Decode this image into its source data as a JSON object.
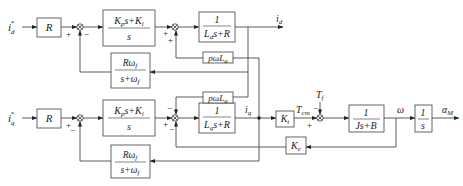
{
  "diagram": {
    "d_axis": {
      "input": "i",
      "input_sub": "d",
      "input_sup": "*",
      "gain_block": "R",
      "pi_block": {
        "num_a": "K",
        "num_a_sub": "p",
        "num_b": "s+K",
        "num_b_sub": "i",
        "den": "s"
      },
      "plant_block": {
        "num": "1",
        "den_a": "L",
        "den_a_sub": "d",
        "den_b": "s+R"
      },
      "output": "i",
      "output_sub": "d",
      "filter_block": {
        "num": "Rω",
        "num_sub": "f",
        "den": "s+ω",
        "den_sub": "f"
      },
      "coupling_block": {
        "text": "pωL",
        "sub": "a"
      },
      "sum1_signs": [
        "+",
        "−"
      ],
      "sum2_signs": [
        "+",
        "+"
      ]
    },
    "q_axis": {
      "input": "i",
      "input_sub": "q",
      "input_sup": "*",
      "gain_block": "R",
      "pi_block": {
        "num_a": "K",
        "num_a_sub": "p",
        "num_b": "s+K",
        "num_b_sub": "i",
        "den": "s"
      },
      "plant_block": {
        "num": "1",
        "den_a": "L",
        "den_a_sub": "q",
        "den_b": "s+R"
      },
      "output": "i",
      "output_sub": "q",
      "filter_block": {
        "num": "Rω",
        "num_sub": "f",
        "den": "s+ω",
        "den_sub": "f"
      },
      "coupling_block": {
        "text": "pωL",
        "sub": "a"
      },
      "sum3_signs": [
        "+",
        "−"
      ],
      "sum4_signs": [
        "−",
        "+",
        "−"
      ]
    },
    "mechanical": {
      "torque_gain": "K",
      "torque_gain_sub": "t",
      "torque_label": "T",
      "torque_label_sub": "cm",
      "load_torque": "T",
      "load_torque_sub": "f",
      "sum5_signs": [
        "−",
        "+"
      ],
      "inertia_block": {
        "num": "1",
        "den": "Js+B"
      },
      "speed": "ω",
      "integrator_block": {
        "num": "1",
        "den": "s"
      },
      "output": "α",
      "output_sub": "M",
      "back_emf_gain": "K",
      "back_emf_gain_sub": "e"
    },
    "colors": {
      "line": "#333333",
      "box_border": "#555555",
      "text": "#222222",
      "background": "#ffffff"
    }
  }
}
